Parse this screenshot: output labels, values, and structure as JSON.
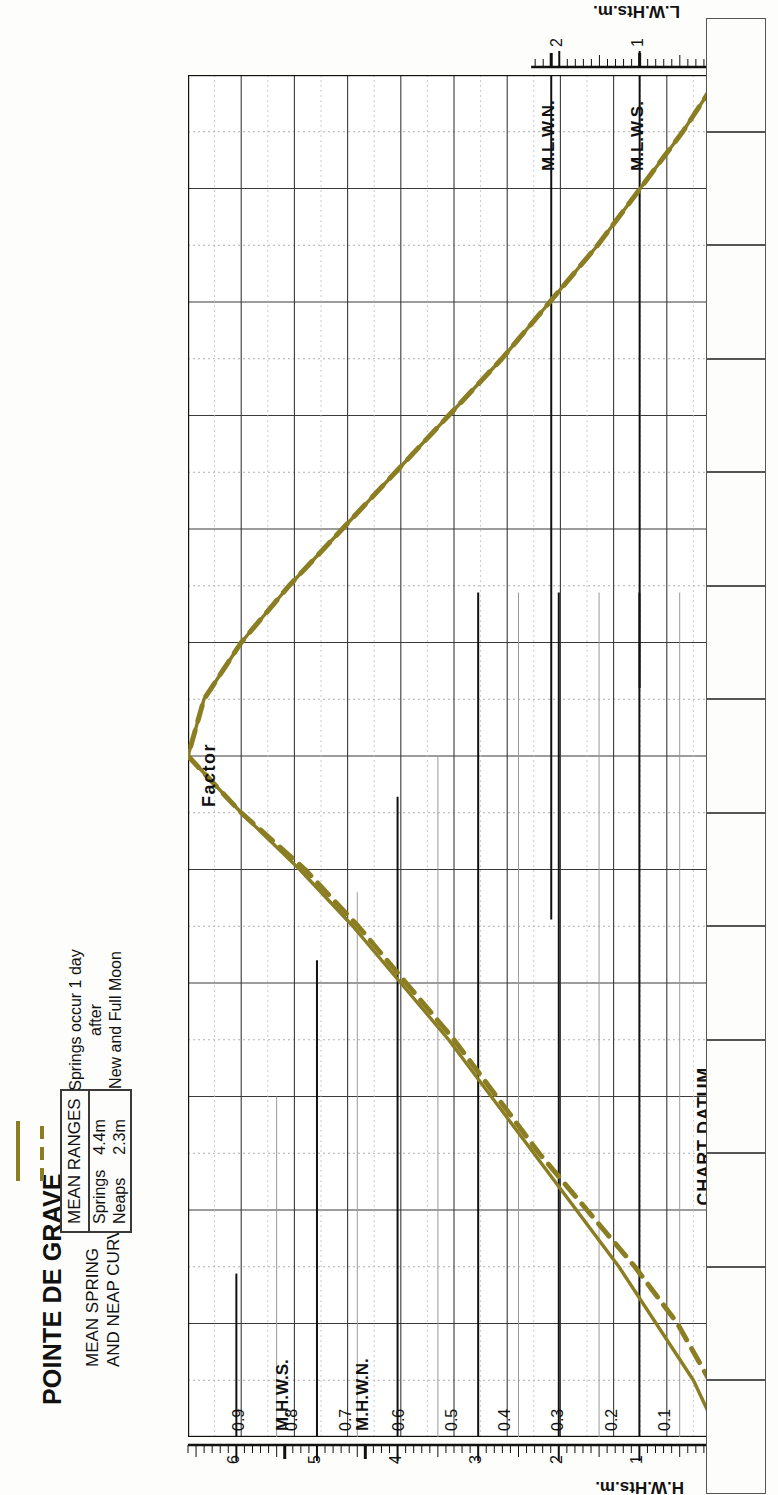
{
  "header": {
    "title": "POINTE DE GRAVE",
    "subtitle_line1": "MEAN SPRING",
    "subtitle_line2": "AND NEAP CURVES",
    "note_line1": "Springs occur 1 day",
    "note_line2": "after",
    "note_line3": "New and Full Moon"
  },
  "legend": {
    "heading": "MEAN RANGES",
    "rows": [
      {
        "label": "Springs",
        "value": "4.4m",
        "style": "solid"
      },
      {
        "label": "Neaps",
        "value": "2.3m",
        "style": "dashed"
      }
    ]
  },
  "axes": {
    "hw_axis_label": "H.W.Hts.m.",
    "lw_axis_label": "L.W.Hts.m.",
    "factor_label": "Factor",
    "chart_datum_label": "CHART DATUM",
    "hw_tick_labels": [
      "0",
      "1",
      "2",
      "3",
      "4",
      "5",
      "6"
    ],
    "lw_tick_labels": [
      "0",
      "1",
      "2"
    ],
    "factor_tick_labels": [
      "0.9",
      "0.8",
      "0.7",
      "0.6",
      "0.5",
      "0.4",
      "0.3",
      "0.2",
      "0.1"
    ],
    "time_tick_labels": [
      "L.W.",
      "-5",
      "-4",
      "-3",
      "-2",
      "-1",
      "H.W.",
      "+1",
      "+2",
      "+3",
      "+4",
      "+5",
      "L.W."
    ],
    "hour_superscript": "h"
  },
  "levels": [
    {
      "name": "M.H.W.S.",
      "value": 5.4,
      "side": "hw"
    },
    {
      "name": "M.H.W.N.",
      "value": 4.4,
      "side": "hw"
    },
    {
      "name": "M.L.W.N.",
      "value": 2.1,
      "side": "lw"
    },
    {
      "name": "M.L.W.S.",
      "value": 1.0,
      "side": "lw"
    }
  ],
  "colors": {
    "curve": "#8a7d22",
    "grid_major": "#3a3a3a",
    "grid_minor": "#9a9a9a",
    "grid_dotted": "#bdbdbd",
    "axis": "#111111"
  },
  "chart_data": {
    "type": "line",
    "xlabel": "Time relative to High Water (hours)",
    "ylabel": "Factor",
    "xlim": [
      -6,
      6
    ],
    "ylim": [
      0,
      1
    ],
    "grid": true,
    "legend_position": "top-left",
    "x": [
      -6,
      -5.5,
      -5,
      -4.5,
      -4,
      -3.5,
      -3,
      -2.5,
      -2,
      -1.5,
      -1,
      -0.5,
      0,
      0.5,
      1,
      1.5,
      2,
      2.5,
      3,
      3.5,
      4,
      4.5,
      5,
      5.5,
      6
    ],
    "series": [
      {
        "name": "Springs",
        "mean_range_m": 4.4,
        "style": "solid",
        "color": "#8a7d22",
        "values": [
          0.0,
          0.05,
          0.12,
          0.19,
          0.27,
          0.35,
          0.43,
          0.51,
          0.6,
          0.69,
          0.79,
          0.9,
          1.0,
          0.97,
          0.9,
          0.81,
          0.71,
          0.61,
          0.51,
          0.41,
          0.32,
          0.23,
          0.15,
          0.07,
          0.0
        ]
      },
      {
        "name": "Neaps",
        "mean_range_m": 2.3,
        "style": "dashed",
        "color": "#8a7d22",
        "values": [
          0.0,
          0.02,
          0.08,
          0.16,
          0.25,
          0.34,
          0.42,
          0.5,
          0.59,
          0.68,
          0.78,
          0.9,
          1.0,
          0.97,
          0.9,
          0.81,
          0.71,
          0.61,
          0.51,
          0.41,
          0.32,
          0.23,
          0.15,
          0.07,
          0.0
        ]
      }
    ],
    "factor_ticks": [
      0.1,
      0.2,
      0.3,
      0.4,
      0.5,
      0.6,
      0.7,
      0.8,
      0.9
    ],
    "hw_height_scale_m": [
      0,
      1,
      2,
      3,
      4,
      5,
      6
    ],
    "lw_height_scale_m": [
      0,
      1,
      2
    ],
    "annotations": [
      {
        "text": "M.H.W.S.",
        "height_m": 5.4
      },
      {
        "text": "M.H.W.N.",
        "height_m": 4.4
      },
      {
        "text": "M.L.W.N.",
        "height_m": 2.1
      },
      {
        "text": "M.L.W.S.",
        "height_m": 1.0
      },
      {
        "text": "CHART DATUM",
        "height_m": 0
      }
    ]
  }
}
